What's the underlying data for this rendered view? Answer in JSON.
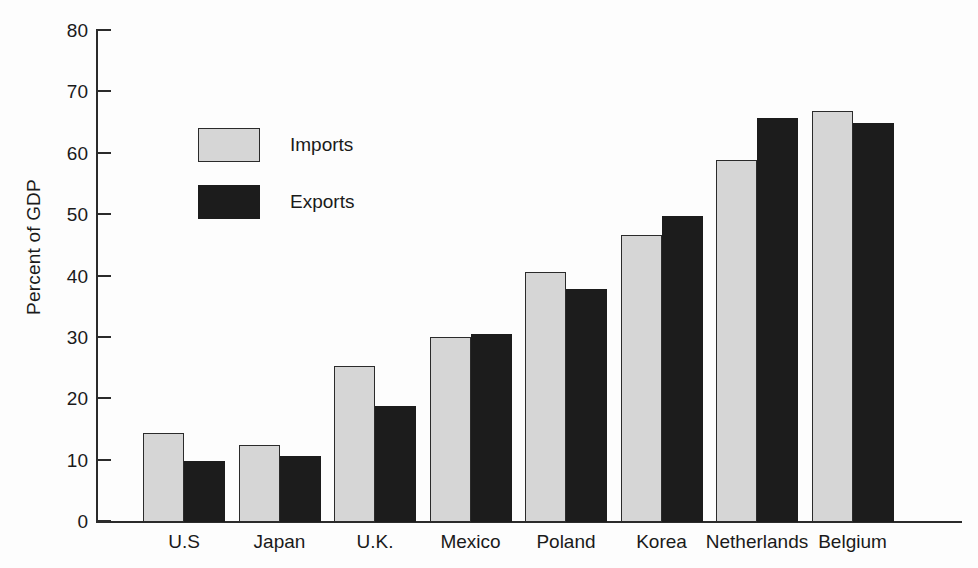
{
  "chart_data": {
    "type": "bar",
    "title": "",
    "subtitle": "",
    "xlabel": "",
    "ylabel": "Percent of GDP",
    "ylim": [
      0,
      80
    ],
    "ytick_step": 10,
    "yticks": [
      0,
      10,
      20,
      30,
      40,
      50,
      60,
      70,
      80
    ],
    "grid": false,
    "legend_position": "upper-left-inside",
    "categories": [
      "U.S",
      "Japan",
      "U.K.",
      "Mexico",
      "Poland",
      "Korea",
      "Netherlands",
      "Belgium"
    ],
    "series": [
      {
        "name": "Imports",
        "color": "#d6d6d6",
        "values": [
          14.5,
          12.5,
          25.5,
          30.2,
          40.8,
          46.8,
          59.0,
          67.0
        ]
      },
      {
        "name": "Exports",
        "color": "#1c1c1c",
        "values": [
          9.9,
          10.7,
          18.9,
          30.7,
          37.9,
          49.9,
          65.9,
          65.0
        ]
      }
    ]
  },
  "axis": {
    "ylabel": "Percent of GDP",
    "tick_labels": [
      "80",
      "70",
      "60",
      "50",
      "40",
      "30",
      "20",
      "10",
      "0"
    ]
  },
  "legend": {
    "items": [
      {
        "label": "Imports",
        "swatch": "light-gray-swatch"
      },
      {
        "label": "Exports",
        "swatch": "black-swatch"
      }
    ]
  },
  "colors": {
    "imports": "#d6d6d6",
    "exports": "#1c1c1c",
    "axis": "#2b2b2b",
    "background": "#fdfdfd"
  }
}
